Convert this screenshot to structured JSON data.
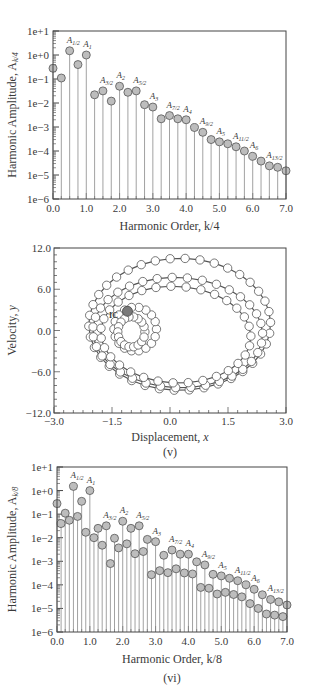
{
  "figure": {
    "panels": [
      "(iv)",
      "(v)",
      "(vi)"
    ]
  },
  "chart_data": [
    {
      "id": "iv",
      "type": "stem",
      "caption": "(iv)",
      "xlabel": "Harmonic Order, k/4",
      "ylabel": "Harmonic Amplitude, A_k/4",
      "yscale": "log",
      "ylim": [
        1e-06,
        10
      ],
      "xlim": [
        0,
        7
      ],
      "yticks": [
        "1e+1",
        "1e+0",
        "1e-1",
        "1e-2",
        "1e-3",
        "1e-4",
        "1e-5",
        "1e-6"
      ],
      "xticks": [
        "0.0",
        "1.0",
        "2.0",
        "3.0",
        "4.0",
        "5.0",
        "6.0",
        "7.0"
      ],
      "grid": false,
      "x": [
        0.0,
        0.25,
        0.5,
        0.75,
        1.0,
        1.25,
        1.5,
        1.75,
        2.0,
        2.25,
        2.5,
        2.75,
        3.0,
        3.25,
        3.5,
        3.75,
        4.0,
        4.25,
        4.5,
        4.75,
        5.0,
        5.25,
        5.5,
        5.75,
        6.0,
        6.25,
        6.5,
        6.75,
        7.0
      ],
      "values": [
        0.28,
        0.11,
        1.5,
        0.4,
        1.0,
        0.022,
        0.032,
        0.012,
        0.05,
        0.028,
        0.032,
        0.0085,
        0.0068,
        0.0022,
        0.003,
        0.0022,
        0.002,
        0.00095,
        0.0006,
        0.0003,
        0.00024,
        0.0002,
        0.00015,
        0.0001,
        6e-05,
        3.8e-05,
        2.4e-05,
        2.1e-05,
        1.5e-05
      ],
      "annotations": [
        {
          "x": 0.5,
          "label": "A",
          "sub": "1/2"
        },
        {
          "x": 1.0,
          "label": "A",
          "sub": "1"
        },
        {
          "x": 1.5,
          "label": "A",
          "sub": "3/2"
        },
        {
          "x": 2.0,
          "label": "A",
          "sub": "2"
        },
        {
          "x": 2.5,
          "label": "A",
          "sub": "5/2"
        },
        {
          "x": 3.0,
          "label": "A",
          "sub": "3"
        },
        {
          "x": 3.5,
          "label": "A",
          "sub": "7/2"
        },
        {
          "x": 4.0,
          "label": "A",
          "sub": "4"
        },
        {
          "x": 4.5,
          "label": "A",
          "sub": "9/2"
        },
        {
          "x": 5.0,
          "label": "A",
          "sub": "5"
        },
        {
          "x": 5.5,
          "label": "A",
          "sub": "11/2"
        },
        {
          "x": 6.0,
          "label": "A",
          "sub": "6"
        },
        {
          "x": 6.5,
          "label": "A",
          "sub": "13/2"
        }
      ]
    },
    {
      "id": "v",
      "type": "scatter",
      "caption": "(v)",
      "xlabel": "Displacement, x",
      "ylabel": "Velocity, y",
      "xlim": [
        -3.0,
        3.0
      ],
      "ylim": [
        -12.0,
        12.0
      ],
      "xticks": [
        "-3.0",
        "-1.5",
        "0.0",
        "1.5",
        "3.0"
      ],
      "yticks": [
        "12.0",
        "6.0",
        "0.0",
        "-6.0",
        "-12.0"
      ],
      "grid": false,
      "description": "Phase trajectory of open circles forming nested loops; filled gray marker labeled IC at initial condition",
      "initial_condition": {
        "x": -1.1,
        "y": 2.8,
        "label": "IC"
      },
      "orbits": [
        {
          "cx": 0.25,
          "cy": 0.9,
          "rx": 2.35,
          "ry": 9.6,
          "rot": -8
        },
        {
          "cx": 0.2,
          "cy": -0.3,
          "rx": 2.2,
          "ry": 8.0,
          "rot": -10
        },
        {
          "cx": 0.15,
          "cy": -0.6,
          "rx": 1.95,
          "ry": 7.0,
          "rot": -12
        },
        {
          "cx": -0.9,
          "cy": 0.2,
          "rx": 0.55,
          "ry": 3.2,
          "rot": 0
        },
        {
          "cx": -1.0,
          "cy": -0.2,
          "rx": 0.35,
          "ry": 2.2,
          "rot": 0
        }
      ]
    },
    {
      "id": "vi",
      "type": "stem",
      "caption": "(vi)",
      "xlabel": "Harmonic Order, k/8",
      "ylabel": "Harmonic Amplitude, A_k/8",
      "yscale": "log",
      "ylim": [
        1e-06,
        10
      ],
      "xlim": [
        0,
        7
      ],
      "yticks": [
        "1e+1",
        "1e+0",
        "1e-1",
        "1e-2",
        "1e-3",
        "1e-4",
        "1e-5",
        "1e-6"
      ],
      "xticks": [
        "0.0",
        "1.0",
        "2.0",
        "3.0",
        "4.0",
        "5.0",
        "6.0",
        "7.0"
      ],
      "grid": false,
      "x": [
        0.0,
        0.125,
        0.25,
        0.375,
        0.5,
        0.625,
        0.75,
        0.875,
        1.0,
        1.125,
        1.25,
        1.375,
        1.5,
        1.625,
        1.75,
        1.875,
        2.0,
        2.125,
        2.25,
        2.375,
        2.5,
        2.625,
        2.75,
        2.875,
        3.0,
        3.125,
        3.25,
        3.375,
        3.5,
        3.625,
        3.75,
        3.875,
        4.0,
        4.125,
        4.25,
        4.375,
        4.5,
        4.625,
        4.75,
        4.875,
        5.0,
        5.125,
        5.25,
        5.375,
        5.5,
        5.625,
        5.75,
        5.875,
        6.0,
        6.125,
        6.25,
        6.375,
        6.5,
        6.625,
        6.75,
        6.875,
        7.0
      ],
      "values": [
        0.28,
        0.04,
        0.11,
        0.055,
        1.5,
        0.08,
        0.35,
        0.017,
        1.0,
        0.01,
        0.025,
        0.0048,
        0.032,
        0.0008,
        0.0095,
        0.0037,
        0.05,
        0.0055,
        0.025,
        0.0021,
        0.032,
        0.0026,
        0.0085,
        0.00027,
        0.0068,
        0.0004,
        0.0018,
        0.00033,
        0.003,
        0.00048,
        0.002,
        0.00032,
        0.002,
        0.00029,
        0.00095,
        7.8e-05,
        0.0007,
        7.2e-05,
        0.00028,
        4.1e-05,
        0.00024,
        4.8e-05,
        0.00019,
        3.9e-05,
        0.00015,
        3.1e-05,
        0.0001,
        1.6e-05,
        6.5e-05,
        1e-05,
        3.8e-05,
        5.8e-06,
        2.4e-05,
        5.2e-06,
        1.9e-05,
        4.5e-06,
        1.4e-05
      ],
      "annotations": [
        {
          "x": 0.5,
          "label": "A",
          "sub": "1/2"
        },
        {
          "x": 1.0,
          "label": "A",
          "sub": "1"
        },
        {
          "x": 1.5,
          "label": "A",
          "sub": "3/2"
        },
        {
          "x": 2.0,
          "label": "A",
          "sub": "2"
        },
        {
          "x": 2.5,
          "label": "A",
          "sub": "5/2"
        },
        {
          "x": 3.0,
          "label": "A",
          "sub": "3"
        },
        {
          "x": 3.5,
          "label": "A",
          "sub": "7/2"
        },
        {
          "x": 4.0,
          "label": "A",
          "sub": "4"
        },
        {
          "x": 4.5,
          "label": "A",
          "sub": "9/2"
        },
        {
          "x": 5.0,
          "label": "A",
          "sub": "5"
        },
        {
          "x": 5.5,
          "label": "A",
          "sub": "11/2"
        },
        {
          "x": 6.0,
          "label": "A",
          "sub": "6"
        },
        {
          "x": 6.5,
          "label": "A",
          "sub": "13/2"
        }
      ]
    }
  ],
  "style": {
    "stem_color": "#8a8a8a",
    "marker_fill": "#bdbdbd",
    "marker_stroke": "#555555",
    "ic_fill": "#7a7a7a",
    "open_marker_fill": "#ffffff",
    "axis_color": "#444444",
    "text_color": "#3a3a3a"
  }
}
